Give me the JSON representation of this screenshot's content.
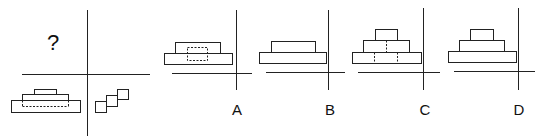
{
  "puzzle": {
    "question_mark": "?",
    "stroke_color": "#222222",
    "background": "#ffffff",
    "given_views": {
      "top_left": "?",
      "bottom_left": "three stacked slabs with dashed hidden edge",
      "bottom_right": "three diagonal overlapping squares"
    },
    "options": [
      {
        "label": "A"
      },
      {
        "label": "B"
      },
      {
        "label": "C"
      },
      {
        "label": "D"
      }
    ]
  }
}
